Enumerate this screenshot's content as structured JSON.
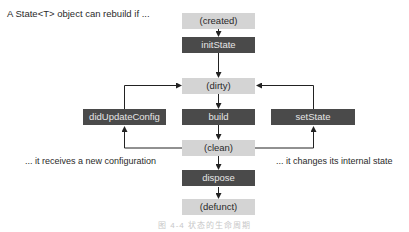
{
  "intro": "A State<T> object can rebuild if ...",
  "nodes": {
    "created": "(created)",
    "init_state": "initState",
    "dirty": "(dirty)",
    "did_update_config": "didUpdateConfig",
    "build": "build",
    "set_state": "setState",
    "clean": "(clean)",
    "dispose": "dispose",
    "defunct": "(defunct)"
  },
  "notes": {
    "left": "... it receives a new configuration",
    "right": "... it changes its internal state"
  },
  "caption": "图 4-4  状态的生命周期",
  "colors": {
    "state_fill": "#d4d4d4",
    "method_fill": "#4a4a4a",
    "method_text": "#e6e6e6",
    "line": "#222222"
  }
}
